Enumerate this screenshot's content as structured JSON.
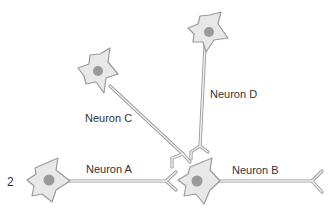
{
  "figure_number": "2",
  "neurons": [
    {
      "id": "A",
      "label": "Neuron A"
    },
    {
      "id": "B",
      "label": "Neuron B"
    },
    {
      "id": "C",
      "label": "Neuron C"
    },
    {
      "id": "D",
      "label": "Neuron D"
    }
  ],
  "colors": {
    "soma_fill": "#e8e8e8",
    "outline": "#9a9a9a",
    "nucleus": "#9a9a9a",
    "text": "#333333",
    "background": "#ffffff"
  }
}
